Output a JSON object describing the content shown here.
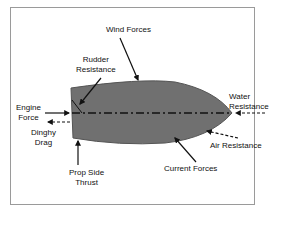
{
  "diagram": {
    "colors": {
      "hull_fill": "#707070",
      "hull_stroke": "#555555",
      "arrow": "#111111",
      "frame_border": "#9a9a9a",
      "text": "#111111"
    },
    "labels": {
      "wind_forces": "Wind Forces",
      "rudder_resistance_line1": "Rudder",
      "rudder_resistance_line2": "Resistance",
      "engine_force_line1": "Engine",
      "engine_force_line2": "Force",
      "dinghy_drag_line1": "Dinghy",
      "dinghy_drag_line2": "Drag",
      "prop_side_thrust_line1": "Prop Side",
      "prop_side_thrust_line2": "Thrust",
      "current_forces": "Current Forces",
      "air_resistance": "Air Resistance",
      "water_resistance_line1": "Water",
      "water_resistance_line2": "Resistance"
    },
    "nodes": [
      {
        "id": "hull",
        "label": "Boat hull (top view)"
      },
      {
        "id": "wind_forces",
        "label": "Wind Forces",
        "arrow_style": "solid",
        "direction": "toward hull top"
      },
      {
        "id": "rudder_resistance",
        "label": "Rudder Resistance",
        "arrow_style": "solid",
        "direction": "toward stern"
      },
      {
        "id": "engine_force",
        "label": "Engine Force",
        "arrow_style": "solid",
        "direction": "into stern along centerline"
      },
      {
        "id": "dinghy_drag",
        "label": "Dinghy Drag",
        "arrow_style": "dashed",
        "direction": "away from stern"
      },
      {
        "id": "prop_side_thrust",
        "label": "Prop Side Thrust",
        "arrow_style": "solid",
        "direction": "upward at stern"
      },
      {
        "id": "current_forces",
        "label": "Current Forces",
        "arrow_style": "solid",
        "direction": "toward hull bottom"
      },
      {
        "id": "air_resistance",
        "label": "Air Resistance",
        "arrow_style": "dashed",
        "direction": "toward bow underside"
      },
      {
        "id": "water_resistance",
        "label": "Water Resistance",
        "arrow_style": "dashed",
        "direction": "into bow along centerline"
      }
    ]
  }
}
